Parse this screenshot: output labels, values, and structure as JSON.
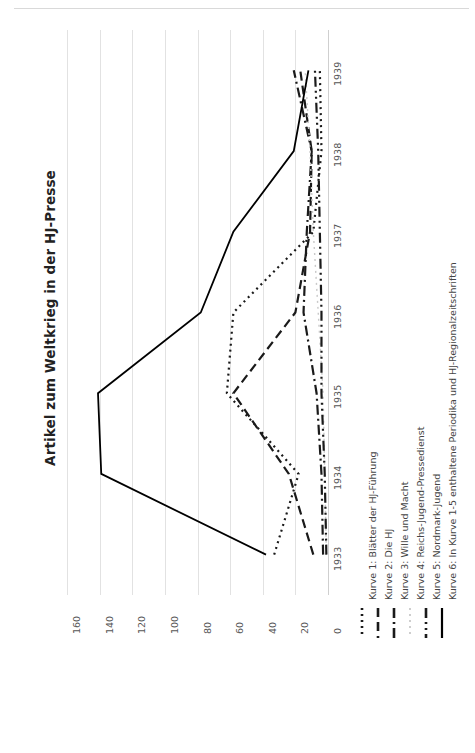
{
  "chart_data": {
    "type": "line",
    "title": "Artikel zum Weltkrieg in der HJ-Presse",
    "xlabel": "",
    "ylabel": "",
    "orientation": "rotated-90",
    "grid": true,
    "legend_position": "right",
    "categories": [
      "1933",
      "1934",
      "1935",
      "1936",
      "1937",
      "1938",
      "1939"
    ],
    "value_ticks": [
      "160",
      "140",
      "120",
      "100",
      "80",
      "60",
      "40",
      "20",
      "0"
    ],
    "ylim": [
      0,
      160
    ],
    "series": [
      {
        "name": "Kurve 1: Blätter der HJ-Führung",
        "style": "dotted",
        "color": "#1a1a1a",
        "values": [
          33,
          18,
          62,
          58,
          9,
          4,
          5
        ]
      },
      {
        "name": "Kurve 2: Die HJ",
        "style": "dashed",
        "color": "#1a1a1a",
        "values": [
          9,
          24,
          58,
          20,
          11,
          10,
          17
        ]
      },
      {
        "name": "Kurve 3: Wille und Macht",
        "style": "dashdot",
        "color": "#1a1a1a",
        "values": [
          3,
          4,
          7,
          15,
          13,
          10,
          21
        ]
      },
      {
        "name": "Kurve 4: Reichs-Jugend-Pressedienst",
        "style": "dotted-light",
        "color": "#c9c9c9",
        "values": [
          1,
          2,
          3,
          6,
          9,
          11,
          14
        ]
      },
      {
        "name": "Kurve 5: Nordmark-Jugend",
        "style": "dashdotdot",
        "color": "#1a1a1a",
        "values": [
          1,
          2,
          4,
          4,
          5,
          6,
          8
        ]
      },
      {
        "name": "Kurve 6: In Kurve 1-5 enthaltene Periodika und HJ-Regionalzeitschriften",
        "style": "solid",
        "color": "#000000",
        "values": [
          38,
          139,
          141,
          78,
          58,
          21,
          12
        ]
      }
    ]
  }
}
